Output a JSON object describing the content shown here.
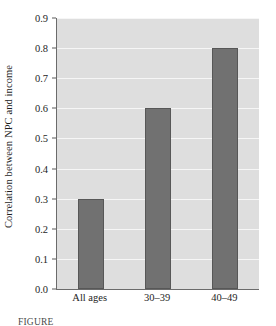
{
  "chart_data": {
    "type": "bar",
    "title": "",
    "xlabel": "",
    "ylabel": "Correlation between NPC and income",
    "categories": [
      "All ages",
      "30–39",
      "40–49"
    ],
    "values": [
      0.3,
      0.6,
      0.8
    ],
    "ylim": [
      0.0,
      0.9
    ],
    "ytick_labels": [
      "0.0",
      "0.1",
      "0.2",
      "0.3",
      "0.4",
      "0.5",
      "0.6",
      "0.7",
      "0.8",
      "0.9"
    ],
    "ytick_values": [
      0.0,
      0.1,
      0.2,
      0.3,
      0.4,
      0.5,
      0.6,
      0.7,
      0.8,
      0.9
    ],
    "grid": true,
    "legend": "none",
    "colors": {
      "bar_fill": "#717171",
      "bar_edge": "#575757",
      "plot_background": "#dedede",
      "gridline": "#f6f6f6",
      "axis": "#6b6b6b",
      "text": "#1e1e1e"
    }
  },
  "caption": {
    "text": "FIGURE"
  }
}
